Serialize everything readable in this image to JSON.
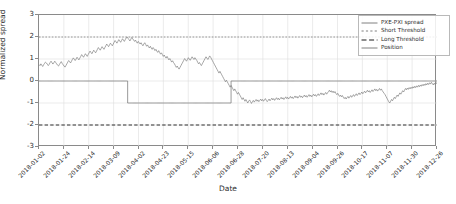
{
  "chart_data": {
    "type": "line",
    "title": "",
    "xlabel": "Date",
    "ylabel": "Normalized spread",
    "ylim": [
      -3,
      3
    ],
    "yticks": [
      3,
      2,
      1,
      0,
      -1,
      -2,
      -3
    ],
    "grid": true,
    "legend_position": "upper right",
    "xticklabels": [
      "2018-01-02",
      "2018-01-24",
      "2018-02-14",
      "2018-03-09",
      "2018-04-02",
      "2018-04-23",
      "2018-05-15",
      "2018-06-06",
      "2018-06-28",
      "2018-07-20",
      "2018-08-13",
      "2018-09-04",
      "2018-09-26",
      "2018-10-17",
      "2018-11-07",
      "2018-11-30",
      "2018-12-26"
    ],
    "annotations": {
      "short_threshold_value": 2,
      "long_threshold_value": -2,
      "position_short_start": "2018-02-20",
      "position_short_end": "2018-06-10",
      "position_short_value": -1,
      "position_flat_value": 0
    },
    "series": [
      {
        "name": "PXE-PXI spread",
        "color": "#808080",
        "style": "solid",
        "values": [
          0.75,
          0.7,
          0.78,
          0.72,
          0.66,
          0.74,
          0.8,
          0.86,
          0.82,
          0.76,
          0.7,
          0.76,
          0.84,
          0.9,
          0.83,
          0.77,
          0.83,
          0.9,
          0.84,
          0.78,
          0.72,
          0.68,
          0.75,
          0.82,
          0.88,
          0.8,
          0.74,
          0.68,
          0.63,
          0.7,
          0.78,
          0.86,
          0.93,
          0.88,
          0.82,
          0.9,
          0.98,
          1.05,
          0.99,
          0.93,
          1.0,
          1.08,
          1.02,
          0.96,
          1.04,
          1.12,
          1.2,
          1.14,
          1.08,
          1.16,
          1.24,
          1.18,
          1.12,
          1.2,
          1.28,
          1.36,
          1.3,
          1.24,
          1.32,
          1.4,
          1.34,
          1.28,
          1.36,
          1.44,
          1.52,
          1.46,
          1.4,
          1.48,
          1.56,
          1.5,
          1.44,
          1.52,
          1.6,
          1.68,
          1.62,
          1.56,
          1.64,
          1.72,
          1.66,
          1.6,
          1.68,
          1.76,
          1.84,
          1.78,
          1.72,
          1.8,
          1.88,
          1.82,
          1.76,
          1.84,
          1.92,
          1.86,
          1.8,
          1.88,
          1.96,
          2.0,
          1.94,
          1.88,
          1.82,
          1.9,
          1.98,
          1.92,
          1.86,
          1.8,
          1.86,
          1.78,
          1.72,
          1.8,
          1.74,
          1.68,
          1.74,
          1.66,
          1.6,
          1.68,
          1.74,
          1.66,
          1.58,
          1.64,
          1.56,
          1.5,
          1.58,
          1.5,
          1.44,
          1.52,
          1.46,
          1.38,
          1.44,
          1.36,
          1.3,
          1.38,
          1.3,
          1.22,
          1.28,
          1.2,
          1.12,
          1.18,
          1.1,
          1.04,
          1.12,
          1.04,
          0.96,
          1.02,
          0.94,
          0.86,
          0.92,
          0.84,
          0.78,
          0.7,
          0.62,
          0.68,
          0.6,
          0.54,
          0.62,
          0.7,
          0.78,
          0.86,
          0.94,
          1.02,
          0.96,
          0.9,
          0.98,
          1.06,
          1.0,
          0.94,
          1.02,
          1.1,
          1.04,
          0.98,
          1.06,
          1.0,
          0.94,
          0.86,
          0.78,
          0.84,
          0.76,
          0.7,
          0.78,
          0.86,
          0.94,
          1.02,
          1.1,
          1.04,
          0.98,
          1.06,
          1.14,
          1.08,
          1.0,
          0.92,
          0.84,
          0.76,
          0.68,
          0.6,
          0.52,
          0.44,
          0.36,
          0.44,
          0.36,
          0.28,
          0.2,
          0.12,
          0.04,
          -0.04,
          0.04,
          -0.04,
          -0.12,
          -0.2,
          -0.28,
          -0.2,
          -0.28,
          -0.36,
          -0.44,
          -0.36,
          -0.44,
          -0.52,
          -0.6,
          -0.52,
          -0.6,
          -0.68,
          -0.76,
          -0.84,
          -0.76,
          -0.84,
          -0.92,
          -0.84,
          -0.92,
          -1.0,
          -0.92,
          -0.86,
          -0.94,
          -1.02,
          -0.94,
          -0.88,
          -0.96,
          -0.9,
          -0.84,
          -0.92,
          -0.86,
          -0.94,
          -0.88,
          -0.82,
          -0.9,
          -0.84,
          -0.92,
          -0.86,
          -0.8,
          -0.88,
          -0.94,
          -0.88,
          -0.82,
          -0.9,
          -0.84,
          -0.78,
          -0.86,
          -0.8,
          -0.88,
          -0.82,
          -0.76,
          -0.84,
          -0.78,
          -0.86,
          -0.8,
          -0.74,
          -0.82,
          -0.76,
          -0.84,
          -0.78,
          -0.72,
          -0.8,
          -0.74,
          -0.82,
          -0.76,
          -0.7,
          -0.78,
          -0.72,
          -0.8,
          -0.74,
          -0.68,
          -0.76,
          -0.7,
          -0.78,
          -0.72,
          -0.66,
          -0.74,
          -0.68,
          -0.76,
          -0.7,
          -0.64,
          -0.72,
          -0.66,
          -0.74,
          -0.68,
          -0.62,
          -0.7,
          -0.64,
          -0.72,
          -0.66,
          -0.6,
          -0.68,
          -0.62,
          -0.7,
          -0.64,
          -0.58,
          -0.66,
          -0.6,
          -0.54,
          -0.62,
          -0.56,
          -0.64,
          -0.58,
          -0.52,
          -0.6,
          -0.54,
          -0.48,
          -0.42,
          -0.5,
          -0.44,
          -0.52,
          -0.46,
          -0.54,
          -0.48,
          -0.56,
          -0.62,
          -0.56,
          -0.64,
          -0.7,
          -0.64,
          -0.72,
          -0.66,
          -0.74,
          -0.8,
          -0.74,
          -0.82,
          -0.76,
          -0.7,
          -0.78,
          -0.72,
          -0.66,
          -0.74,
          -0.68,
          -0.62,
          -0.7,
          -0.64,
          -0.58,
          -0.66,
          -0.6,
          -0.54,
          -0.62,
          -0.56,
          -0.5,
          -0.58,
          -0.52,
          -0.46,
          -0.54,
          -0.48,
          -0.42,
          -0.5,
          -0.44,
          -0.52,
          -0.46,
          -0.4,
          -0.48,
          -0.42,
          -0.36,
          -0.44,
          -0.38,
          -0.46,
          -0.4,
          -0.34,
          -0.42,
          -0.36,
          -0.44,
          -0.5,
          -0.56,
          -0.62,
          -0.7,
          -0.78,
          -0.86,
          -0.94,
          -1.0,
          -0.92,
          -0.84,
          -0.9,
          -0.82,
          -0.74,
          -0.8,
          -0.72,
          -0.64,
          -0.7,
          -0.62,
          -0.54,
          -0.6,
          -0.52,
          -0.44,
          -0.5,
          -0.42,
          -0.34,
          -0.4,
          -0.32,
          -0.38,
          -0.3,
          -0.36,
          -0.28,
          -0.34,
          -0.26,
          -0.32,
          -0.24,
          -0.3,
          -0.22,
          -0.28,
          -0.2,
          -0.26,
          -0.18,
          -0.24,
          -0.16,
          -0.22,
          -0.14,
          -0.2,
          -0.12,
          -0.18,
          -0.1,
          -0.16,
          -0.08,
          -0.14,
          -0.06,
          -0.12,
          -0.18,
          -0.1,
          -0.16,
          -0.08,
          -0.12
        ]
      },
      {
        "name": "Position",
        "color": "#808080",
        "style": "step",
        "values": [
          0,
          0,
          0,
          0,
          0,
          0,
          0,
          0,
          0,
          0,
          0,
          0,
          0,
          0,
          0,
          0,
          0,
          0,
          0,
          0,
          0,
          0,
          0,
          0,
          0,
          0,
          0,
          0,
          0,
          0,
          0,
          0,
          0,
          0,
          0,
          0,
          0,
          0,
          0,
          0,
          0,
          0,
          0,
          0,
          0,
          0,
          0,
          0,
          0,
          0,
          0,
          0,
          0,
          0,
          0,
          0,
          0,
          0,
          0,
          0,
          0,
          0,
          0,
          0,
          0,
          0,
          0,
          0,
          0,
          0,
          0,
          0,
          0,
          0,
          0,
          0,
          0,
          0,
          0,
          0,
          0,
          0,
          0,
          0,
          0,
          0,
          0,
          0,
          0,
          0,
          0,
          0,
          0,
          0,
          0,
          0,
          -1,
          -1,
          -1,
          -1,
          -1,
          -1,
          -1,
          -1,
          -1,
          -1,
          -1,
          -1,
          -1,
          -1,
          -1,
          -1,
          -1,
          -1,
          -1,
          -1,
          -1,
          -1,
          -1,
          -1,
          -1,
          -1,
          -1,
          -1,
          -1,
          -1,
          -1,
          -1,
          -1,
          -1,
          -1,
          -1,
          -1,
          -1,
          -1,
          -1,
          -1,
          -1,
          -1,
          -1,
          -1,
          -1,
          -1,
          -1,
          -1,
          -1,
          -1,
          -1,
          -1,
          -1,
          -1,
          -1,
          -1,
          -1,
          -1,
          -1,
          -1,
          -1,
          -1,
          -1,
          -1,
          -1,
          -1,
          -1,
          -1,
          -1,
          -1,
          -1,
          -1,
          -1,
          -1,
          -1,
          -1,
          -1,
          -1,
          -1,
          -1,
          -1,
          -1,
          -1,
          -1,
          -1,
          -1,
          -1,
          -1,
          -1,
          -1,
          -1,
          -1,
          -1,
          -1,
          -1,
          -1,
          -1,
          -1,
          -1,
          -1,
          -1,
          -1,
          -1,
          -1,
          -1,
          -1,
          -1,
          -1,
          -1,
          -1,
          -1,
          0,
          0,
          0,
          0,
          0,
          0,
          0,
          0,
          0,
          0,
          0,
          0,
          0,
          0,
          0,
          0,
          0,
          0,
          0,
          0,
          0,
          0,
          0,
          0,
          0,
          0,
          0,
          0,
          0,
          0,
          0,
          0,
          0,
          0,
          0,
          0,
          0,
          0,
          0,
          0,
          0,
          0,
          0,
          0,
          0,
          0,
          0,
          0,
          0,
          0,
          0,
          0,
          0,
          0,
          0,
          0,
          0,
          0,
          0,
          0,
          0,
          0,
          0,
          0,
          0,
          0,
          0,
          0,
          0,
          0,
          0,
          0,
          0,
          0,
          0,
          0,
          0,
          0,
          0,
          0,
          0,
          0,
          0,
          0,
          0,
          0,
          0,
          0,
          0,
          0,
          0,
          0,
          0,
          0,
          0,
          0,
          0,
          0,
          0,
          0,
          0,
          0,
          0,
          0,
          0,
          0,
          0,
          0,
          0,
          0,
          0,
          0,
          0,
          0,
          0,
          0,
          0,
          0,
          0,
          0,
          0,
          0,
          0,
          0,
          0,
          0,
          0,
          0,
          0,
          0,
          0,
          0,
          0,
          0,
          0,
          0,
          0,
          0,
          0,
          0,
          0,
          0,
          0,
          0,
          0,
          0,
          0,
          0,
          0,
          0,
          0,
          0,
          0,
          0,
          0,
          0,
          0,
          0,
          0,
          0,
          0,
          0,
          0,
          0,
          0,
          0,
          0,
          0,
          0,
          0,
          0,
          0,
          0,
          0,
          0,
          0,
          0,
          0,
          0,
          0,
          0,
          0,
          0,
          0,
          0,
          0,
          0,
          0,
          0,
          0,
          0,
          0,
          0,
          0,
          0,
          0,
          0,
          0,
          0,
          0,
          0,
          0,
          0,
          0,
          0,
          0,
          0,
          0,
          0,
          0,
          0,
          0,
          0,
          0,
          0,
          0,
          0,
          0,
          0,
          0,
          0,
          0,
          0,
          0
        ]
      }
    ],
    "threshold_lines": [
      {
        "name": "Short Threshold",
        "value": 2,
        "color": "#808080",
        "style": "dotted"
      },
      {
        "name": "Long Threshold",
        "value": -2,
        "color": "#1a1a1a",
        "style": "dashed"
      }
    ]
  },
  "legend": {
    "items": [
      {
        "label": "PXE-PXI spread",
        "key": "solid-line-key"
      },
      {
        "label": "Short Threshold",
        "key": "dotted-line-key"
      },
      {
        "label": "Long Threshold",
        "key": "dashed-line-key"
      },
      {
        "label": "Position",
        "key": "solid-line-key"
      }
    ]
  }
}
